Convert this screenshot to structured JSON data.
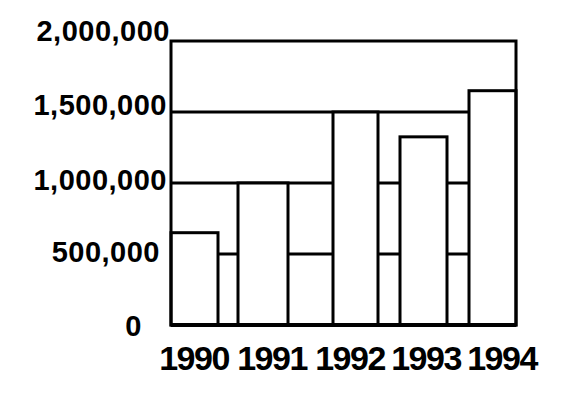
{
  "chart_data": {
    "type": "bar",
    "categories": [
      "1990",
      "1991",
      "1992",
      "1993",
      "1994"
    ],
    "values": [
      650000,
      1000000,
      1500000,
      1325000,
      1650000
    ],
    "title": "",
    "xlabel": "",
    "ylabel": "",
    "ylim": [
      0,
      2000000
    ],
    "yticks": [
      0,
      500000,
      1000000,
      1500000,
      2000000
    ],
    "ytick_labels": [
      "0",
      "500,000",
      "1,000,000",
      "1,500,000",
      "2,000,000"
    ],
    "grid": true,
    "grid_note": "horizontal gridlines every 500,000; bars are white-filled and drawn over the gridlines, so gridlines show only in gaps between bars and above shorter bars; plot is enclosed in a full black frame (top frame = 2,000,000 line)",
    "legend": "none",
    "colors": {
      "background": "#ffffff",
      "line": "#000000",
      "bar_fill": "#ffffff",
      "bar_stroke": "#000000"
    },
    "layout": {
      "plot_px": {
        "left": 171,
        "top": 41,
        "right": 516,
        "bottom": 325
      },
      "bar_x_px": [
        [
          171,
          218
        ],
        [
          238,
          288
        ],
        [
          333,
          378
        ],
        [
          400,
          447
        ],
        [
          469,
          516
        ]
      ],
      "stroke_px": 3
    }
  }
}
